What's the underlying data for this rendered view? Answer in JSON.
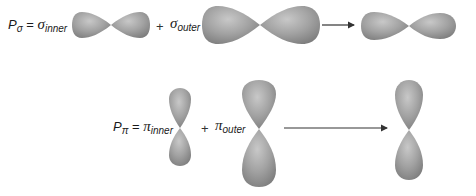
{
  "equations": {
    "sigma": {
      "lhs_symbol": "P",
      "lhs_sub": "σ",
      "equals": "=",
      "inner_symbol": "σ",
      "inner_sub": "inner",
      "plus": "+",
      "outer_symbol": "σ",
      "outer_sub": "outer"
    },
    "pi": {
      "lhs_symbol": "P",
      "lhs_sub": "π",
      "equals": "=",
      "inner_symbol": "π",
      "inner_sub": "inner",
      "plus": "+",
      "outer_symbol": "π",
      "outer_sub": "outer"
    }
  },
  "colors": {
    "lobe_light": "#c4c4c4",
    "lobe_mid": "#9a9a9a",
    "lobe_dark": "#7a7a7a",
    "arrow": "#333333",
    "text": "#1a1a1a"
  }
}
